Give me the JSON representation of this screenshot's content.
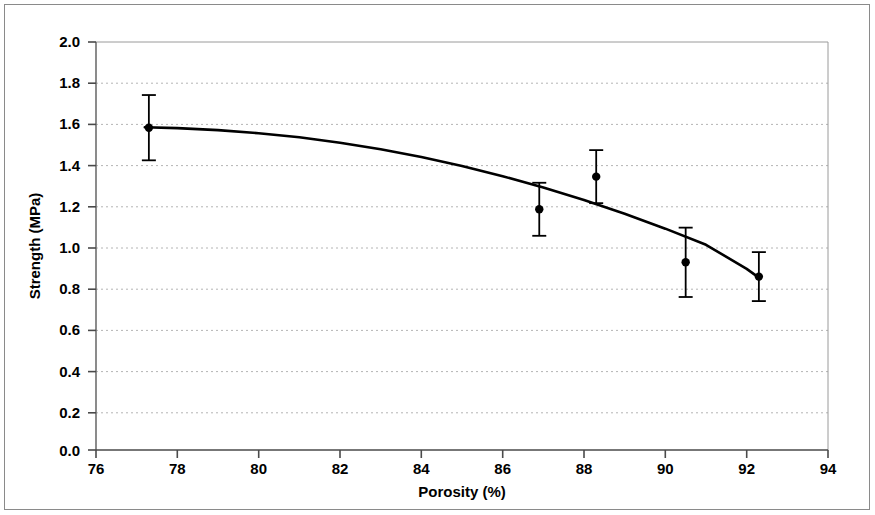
{
  "chart_data": {
    "type": "scatter",
    "title": "",
    "xlabel": "Porosity (%)",
    "ylabel": "Strength (MPa)",
    "xlim": [
      76,
      94
    ],
    "ylim": [
      0.0,
      2.0
    ],
    "xticks": [
      76,
      78,
      80,
      82,
      84,
      86,
      88,
      90,
      92,
      94
    ],
    "yticks": [
      0.0,
      0.2,
      0.4,
      0.6,
      0.8,
      1.0,
      1.2,
      1.4,
      1.6,
      1.8,
      2.0
    ],
    "xtick_labels": [
      "76",
      "78",
      "80",
      "82",
      "84",
      "86",
      "88",
      "90",
      "92",
      "94"
    ],
    "ytick_labels": [
      "0.0",
      "0.2",
      "0.4",
      "0.6",
      "0.8",
      "1.0",
      "1.2",
      "1.4",
      "1.6",
      "1.8",
      "2.0"
    ],
    "grid": "horizontal-dotted",
    "legend": null,
    "series": [
      {
        "name": "Measured strength",
        "type": "scatter",
        "marker": "filled-circle",
        "color": "#000000",
        "error_bars": "vertical",
        "points": [
          {
            "x": 77.3,
            "y": 1.58,
            "yerr": 0.16
          },
          {
            "x": 86.9,
            "y": 1.18,
            "yerr": 0.13
          },
          {
            "x": 88.3,
            "y": 1.34,
            "yerr": 0.13
          },
          {
            "x": 90.5,
            "y": 0.92,
            "yerr": 0.17
          },
          {
            "x": 92.3,
            "y": 0.85,
            "yerr": 0.12
          }
        ]
      },
      {
        "name": "Fitted curve",
        "type": "line",
        "color": "#000000",
        "x": [
          77.2,
          78.0,
          79.0,
          80.0,
          81.0,
          82.0,
          83.0,
          84.0,
          85.0,
          86.0,
          87.0,
          88.0,
          89.0,
          90.0,
          91.0,
          92.0,
          92.3
        ],
        "y": [
          1.582,
          1.578,
          1.568,
          1.553,
          1.533,
          1.506,
          1.474,
          1.436,
          1.392,
          1.342,
          1.287,
          1.225,
          1.158,
          1.085,
          1.006,
          0.888,
          0.845
        ]
      }
    ]
  },
  "figure": {
    "border_color": "#8a8a8a",
    "plot_border_color": "#9a9a9a",
    "gridline_color": "#b4b4b4",
    "data_color": "#000000",
    "background": "#ffffff"
  }
}
